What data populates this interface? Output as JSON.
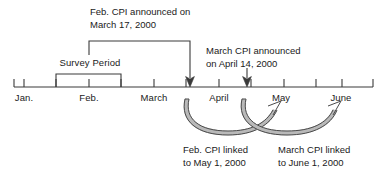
{
  "diagram": {
    "title_role": "cpi-timeline",
    "axis": {
      "start_x": 14,
      "end_x": 373,
      "baseline_y": 87,
      "tick_height": 9,
      "color": "#3a3a3a"
    },
    "month_ticks": [
      {
        "label": "Jan.",
        "x": 24,
        "has_label": true
      },
      {
        "label": "",
        "x": 56,
        "has_label": false
      },
      {
        "label": "Feb.",
        "x": 89,
        "has_label": true
      },
      {
        "label": "",
        "x": 121,
        "has_label": false
      },
      {
        "label": "March",
        "x": 154,
        "has_label": true
      },
      {
        "label": "",
        "x": 186,
        "has_label": false
      },
      {
        "label": "April",
        "x": 219,
        "has_label": true
      },
      {
        "label": "",
        "x": 251,
        "has_label": false
      },
      {
        "label": "May",
        "x": 284,
        "has_label": true
      },
      {
        "label": "",
        "x": 316,
        "has_label": false
      },
      {
        "label": "June",
        "x": 342,
        "has_label": true
      }
    ],
    "month_label_y": 92,
    "survey_period": {
      "label": "Survey Period",
      "label_x": 90,
      "label_y": 57,
      "bracket_left_x": 56,
      "bracket_right_x": 121,
      "bracket_top_y": 74
    },
    "annotation_feb": {
      "line1": "Feb. CPI announced on",
      "line2": "March 17, 2000",
      "text_x": 90,
      "text_y": 6,
      "connector_start_x": 89,
      "connector_top_y": 41,
      "connector_end_x": 190,
      "arrow_tip_y": 86
    },
    "annotation_march": {
      "line1": "March CPI announced",
      "line2": "on April 14, 2000",
      "text_x": 206,
      "text_y": 45,
      "arrow_x": 247,
      "arrow_top_y": 71,
      "arrow_tip_y": 86
    },
    "link_arcs": [
      {
        "name": "feb-cpi-to-may-arc",
        "from_x": 190,
        "to_x": 278,
        "top_y": 100,
        "bottom_y": 130
      },
      {
        "name": "march-cpi-to-june-arc",
        "from_x": 247,
        "to_x": 338,
        "top_y": 100,
        "bottom_y": 130
      }
    ],
    "caption_feb_link": {
      "line1": "Feb. CPI linked",
      "line2": "to May 1, 2000",
      "text_x": 183,
      "text_y": 144
    },
    "caption_march_link": {
      "line1": "March CPI linked",
      "line2": "to June 1, 2000",
      "text_x": 278,
      "text_y": 144
    },
    "colors": {
      "line": "#3a3a3a",
      "text": "#1a1a1a",
      "arc_outer": "#4a4a4a",
      "arc_inner": "#b8b8b8",
      "background": "#ffffff"
    }
  }
}
